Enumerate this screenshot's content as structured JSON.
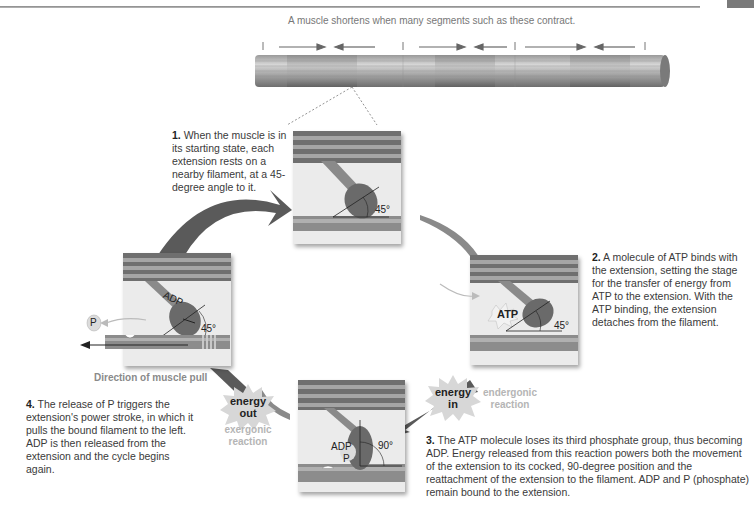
{
  "caption": "A muscle shortens when many segments such as these contract.",
  "steps": [
    {
      "num": "1.",
      "text": "When the muscle is in its starting state, each extension rests on a nearby filament, at a 45-degree angle to it."
    },
    {
      "num": "2.",
      "text": "A molecule of ATP binds with the extension, setting the stage for the transfer of energy from ATP to the extension. With the ATP binding, the extension detaches from the filament."
    },
    {
      "num": "3.",
      "text": "The ATP molecule loses its third phosphate group, thus becoming ADP. Energy released from this reaction powers both the movement of the extension to its cocked, 90-degree position and the reattachment of the extension to the filament. ADP and P (phosphate) remain bound to the extension."
    },
    {
      "num": "4.",
      "text": "The release of P triggers the extension's power stroke, in which it pulls the bound filament to the left. ADP is then released from the extension and the cycle begins again."
    }
  ],
  "panels": {
    "top": {
      "angle": "45°"
    },
    "right": {
      "molecule": "ATP",
      "angle": "45°"
    },
    "bottom": {
      "molecule": "ADP",
      "phosphate": "P",
      "angle": "90°"
    },
    "left": {
      "molecule": "ADP",
      "phosphate": "P",
      "angle": "45°",
      "direction": "Direction of muscle pull"
    }
  },
  "energy": {
    "in": {
      "line1": "energy",
      "line2": "in",
      "reaction1": "endergonic",
      "reaction2": "reaction"
    },
    "out": {
      "line1": "energy",
      "line2": "out",
      "reaction1": "exergonic",
      "reaction2": "reaction"
    }
  },
  "colors": {
    "arrow": "#5a5a5a",
    "panel_bg": "#ebebeb",
    "filament": "#8c8c8c",
    "muted_text": "#b5b5b5"
  }
}
